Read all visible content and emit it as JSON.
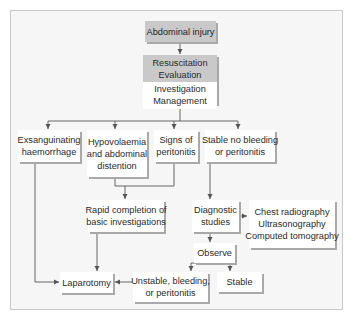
{
  "diagram": {
    "type": "flowchart",
    "nodes": {
      "abdominal_injury": {
        "lines": [
          "Abdominal injury"
        ],
        "style": "gray"
      },
      "resuscitation": {
        "top_lines": [
          "Resuscitation",
          "Evaluation"
        ],
        "bottom_lines": [
          "Investigation",
          "Management"
        ]
      },
      "exsanguinating": {
        "lines": [
          "Exsanguinating",
          "haemorrhage"
        ]
      },
      "hypovolaemia": {
        "lines": [
          "Hypovolaemia",
          "and abdominal",
          "distention"
        ]
      },
      "signs_peritonitis": {
        "lines": [
          "Signs of",
          "peritonitis"
        ]
      },
      "stable_no_bleeding": {
        "lines": [
          "Stable no bleeding",
          "or peritonitis"
        ]
      },
      "rapid_completion": {
        "lines": [
          "Rapid completion of",
          "basic investigations"
        ]
      },
      "diagnostic_studies": {
        "lines": [
          "Diagnostic",
          "studies"
        ]
      },
      "imaging": {
        "lines": [
          "Chest radiography",
          "Ultrasonography",
          "Computed tomography"
        ]
      },
      "observe": {
        "lines": [
          "Observe"
        ]
      },
      "unstable": {
        "lines": [
          "Unstable, bleeding,",
          "or peritonitis"
        ]
      },
      "stable": {
        "lines": [
          "Stable"
        ]
      },
      "laparotomy": {
        "lines": [
          "Laparotomy"
        ]
      }
    },
    "edges": [
      [
        "abdominal_injury",
        "resuscitation"
      ],
      [
        "resuscitation",
        "exsanguinating"
      ],
      [
        "resuscitation",
        "hypovolaemia"
      ],
      [
        "resuscitation",
        "signs_peritonitis"
      ],
      [
        "resuscitation",
        "stable_no_bleeding"
      ],
      [
        "hypovolaemia",
        "rapid_completion"
      ],
      [
        "signs_peritonitis",
        "rapid_completion"
      ],
      [
        "stable_no_bleeding",
        "diagnostic_studies"
      ],
      [
        "diagnostic_studies",
        "imaging"
      ],
      [
        "diagnostic_studies",
        "observe"
      ],
      [
        "observe",
        "unstable"
      ],
      [
        "observe",
        "stable"
      ],
      [
        "unstable",
        "laparotomy"
      ],
      [
        "rapid_completion",
        "laparotomy"
      ],
      [
        "exsanguinating",
        "laparotomy"
      ]
    ],
    "colors": {
      "header_fill": "#c9c9c9",
      "box_fill": "#ffffff",
      "shadow": "#a9a9a9",
      "line": "#555555",
      "frame_bg": "#f6f6f6"
    }
  }
}
